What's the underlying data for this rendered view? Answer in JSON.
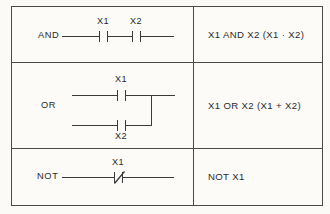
{
  "diagram": {
    "line_color": "#3b3b3b",
    "border_color": "#4a4a4a",
    "background_color": "#fbfaf7",
    "columns": [
      "Ladder diagram",
      "Boolean expression"
    ],
    "rows": [
      {
        "gate": "AND",
        "expression": "X1 AND X2 (X1 · X2)",
        "contacts": [
          {
            "tag": "X1",
            "type": "normally-open"
          },
          {
            "tag": "X2",
            "type": "normally-open"
          }
        ]
      },
      {
        "gate": "OR",
        "expression": "X1 OR X2 (X1 + X2)",
        "contacts": [
          {
            "tag": "X1",
            "type": "normally-open"
          },
          {
            "tag": "X2",
            "type": "normally-open"
          }
        ]
      },
      {
        "gate": "NOT",
        "expression": "NOT X1",
        "contacts": [
          {
            "tag": "X1",
            "type": "normally-closed"
          }
        ]
      }
    ]
  }
}
